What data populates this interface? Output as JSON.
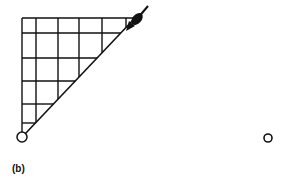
{
  "figure": {
    "panel_label": "(b)",
    "stroke_color": "#111111",
    "background": "#ffffff",
    "grid": {
      "vertical_x": [
        22,
        36,
        58,
        79,
        102,
        126
      ],
      "horizontal_y": [
        18,
        33,
        58,
        81,
        104,
        123
      ],
      "diagonal": {
        "from": [
          22,
          137
        ],
        "to": [
          135,
          18
        ]
      }
    },
    "start_marker": {
      "type": "open-circle",
      "cx": 22,
      "cy": 137,
      "r": 5
    },
    "end_marker": {
      "type": "open-circle",
      "cx": 268,
      "cy": 138,
      "r": 4
    },
    "arrow": {
      "type": "filled-blob-arrow",
      "tip": [
        126,
        31
      ],
      "blob_center": [
        137,
        19
      ],
      "tail": [
        148,
        6
      ]
    }
  }
}
